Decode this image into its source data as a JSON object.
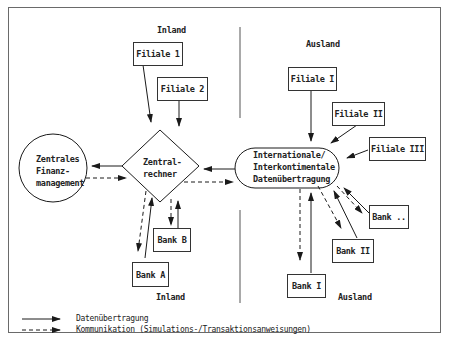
{
  "regions": {
    "inland_top": "Inland",
    "inland_bottom": "Inland",
    "ausland_top": "Ausland",
    "ausland_bottom": "Ausland"
  },
  "nodes": {
    "filiale_1": "Filiale 1",
    "filiale_2": "Filiale 2",
    "filiale_I": "Filiale I",
    "filiale_II": "Filiale II",
    "filiale_III": "Filiale III",
    "zentrales": [
      "Zentrales",
      "Finanz-",
      "management"
    ],
    "zentralrechner": [
      "Zentral-",
      "rechner"
    ],
    "international": [
      "Internationale/",
      "Interkontimentale",
      "Datenübertragung"
    ],
    "bank_A": "Bank A",
    "bank_B": "Bank B",
    "bank_I": "Bank I",
    "bank_II": "Bank II",
    "bank_more": "Bank .."
  },
  "legend": {
    "solid": "Datenübertragung",
    "dashed": "Kommunikation (Simulations-/Transaktionsanweisungen)"
  },
  "colors": {
    "line": "#1a1a1a",
    "border": "#6a6a6a",
    "background": "#ffffff"
  }
}
